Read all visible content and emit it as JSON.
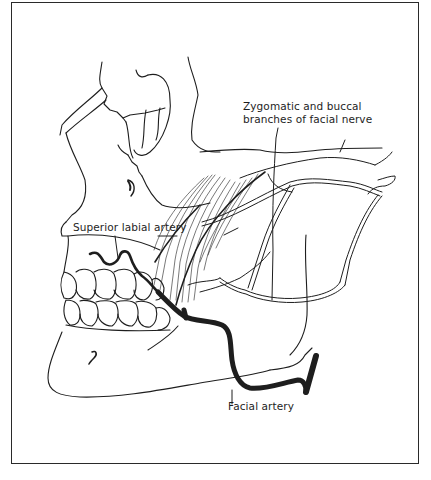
{
  "figure": {
    "type": "anatomical line illustration",
    "colors": {
      "ink": "#1e1e1e",
      "background": "#ffffff",
      "frame": "#2a2a2a"
    },
    "labels": {
      "nerve_line1": "Zygomatic and buccal",
      "nerve_line2": "branches of facial nerve",
      "superior_labial": "Superior labial artery",
      "facial_artery": "Facial artery"
    }
  }
}
